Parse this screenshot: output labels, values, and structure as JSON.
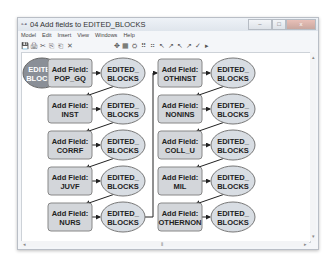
{
  "window": {
    "title": "04 Add fields to EDITED_BLOCKS",
    "app_icon": "model-icon",
    "buttons": {
      "minimize": "–",
      "maximize": "□",
      "close": "x"
    }
  },
  "menubar": [
    "Model",
    "Edit",
    "Insert",
    "View",
    "Windows",
    "Help"
  ],
  "toolbar": {
    "left": [
      "💾",
      "🖨",
      "✂",
      "⎘",
      "⎗",
      "✕"
    ],
    "right": [
      "✥",
      "▦",
      "⛭",
      "⠿",
      "⠶",
      "↖",
      "↗",
      "↖",
      "↗",
      "✓",
      "▸"
    ]
  },
  "colors": {
    "input_ellipse": "#8a8f97",
    "output_ellipse": "#d8dde3",
    "tool_box": "#d3d6da",
    "connector": "#222222"
  },
  "diagram": {
    "input": {
      "line1": "EDITED",
      "line2": "BLOCKS"
    },
    "tools": [
      {
        "line1": "Add Field:",
        "line2": "POP_GQ"
      },
      {
        "line1": "Add Field:",
        "line2": "INST"
      },
      {
        "line1": "Add Field:",
        "line2": "CORRF"
      },
      {
        "line1": "Add Field:",
        "line2": "JUVF"
      },
      {
        "line1": "Add Field:",
        "line2": "NURS"
      },
      {
        "line1": "Add Field:",
        "line2": "OTHINST"
      },
      {
        "line1": "Add Field:",
        "line2": "NONINS"
      },
      {
        "line1": "Add Field:",
        "line2": "COLL_U"
      },
      {
        "line1": "Add Field:",
        "line2": "MIL"
      },
      {
        "line1": "Add Field:",
        "line2": "OTHERNON"
      }
    ],
    "outputs": [
      {
        "line1": "EDITED_",
        "line2": "BLOCKS"
      },
      {
        "line1": "EDITED_",
        "line2": "BLOCKS"
      },
      {
        "line1": "EDITED_",
        "line2": "BLOCKS"
      },
      {
        "line1": "EDITED_",
        "line2": "BLOCKS"
      },
      {
        "line1": "EDITED_",
        "line2": "BLOCKS"
      },
      {
        "line1": "EDITED_",
        "line2": "BLOCKS"
      },
      {
        "line1": "EDITED_",
        "line2": "BLOCKS"
      },
      {
        "line1": "EDITED_",
        "line2": "BLOCKS"
      },
      {
        "line1": "EDITED_",
        "line2": "BLOCKS"
      },
      {
        "line1": "EDITED_",
        "line2": "BLOCKS"
      }
    ]
  },
  "scrollbars": {
    "left": "◂",
    "right": "▸",
    "up": "▴",
    "down": "▾",
    "thumb": "⦀"
  }
}
